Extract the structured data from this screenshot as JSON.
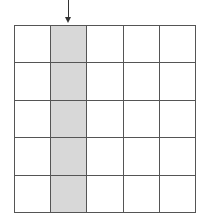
{
  "diagram": {
    "type": "grid",
    "rows": 5,
    "cols": 5,
    "highlighted_column": 2,
    "highlight_color": "#d8d8d8",
    "arrow": {
      "points_to_column": 2,
      "direction": "down"
    }
  }
}
